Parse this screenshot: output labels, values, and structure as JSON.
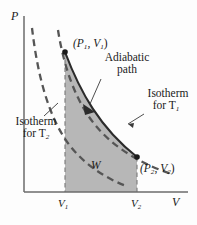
{
  "figure": {
    "background_color": "#fdfdfd",
    "axes": {
      "y_label": "P",
      "x_label": "V",
      "axis_color": "#6b6b6b"
    },
    "ticks": {
      "x": [
        {
          "label": "V",
          "sub": "1",
          "x_px": 65
        },
        {
          "label": "V",
          "sub": "2",
          "x_px": 137
        }
      ]
    },
    "points": [
      {
        "name": "state-1",
        "label_main": "(P",
        "label_sub1": "1",
        "label_mid": ", V",
        "label_sub2": "1",
        "label_end": ")",
        "x_px": 65,
        "y_px": 52
      },
      {
        "name": "state-2",
        "label_main": "(P",
        "label_sub1": "2",
        "label_mid": ", V",
        "label_sub2": "2",
        "label_end": ")",
        "x_px": 137,
        "y_px": 157
      }
    ],
    "annotations": {
      "adiabatic": {
        "line1": "Adiabatic",
        "line2": "path"
      },
      "isotherm_t1": {
        "line1": "Isotherm",
        "line2": "for T",
        "sub": "1"
      },
      "isotherm_t2": {
        "line1": "Isotherm",
        "line2": "for T",
        "sub": "2"
      },
      "work_region": "W"
    },
    "colors": {
      "shaded_work_region": "#b3b3b3",
      "adiabatic_curve": "#2b2b2b",
      "isotherm_dashed": "#555555",
      "dropline_dashed": "#777777",
      "text": "#1a1a1a"
    },
    "curves": [
      {
        "name": "adiabatic-path",
        "style": "solid",
        "has_arrow": true,
        "direction": "expansion"
      },
      {
        "name": "isotherm-t1",
        "style": "dashed",
        "passes_through": "state-2"
      },
      {
        "name": "isotherm-t2",
        "style": "dashed",
        "passes_through": "state-1"
      }
    ]
  }
}
